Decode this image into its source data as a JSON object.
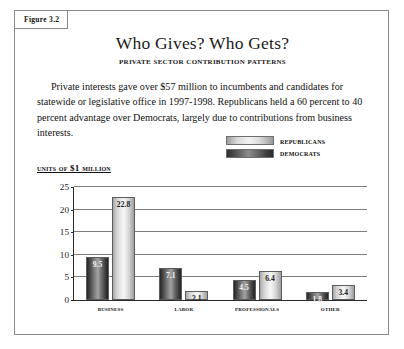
{
  "figure": {
    "tag": "Figure 3.2",
    "title": "Who Gives? Who Gets?",
    "subtitle": "Private Sector Contribution Patterns",
    "body": "Private interests gave over $57 million to incumbents and candidates for statewide or legislative office in 1997-1998. Republicans held a 60 percent to 40 percent advantage over Democrats, largely due to contributions from business interests.",
    "units_label": "Units of $1 Million",
    "border_color": "#8a8a8a"
  },
  "legend": {
    "items": [
      {
        "label": "Republicans",
        "swatch": "light-gradient-swatch",
        "color": "#f3f3f3"
      },
      {
        "label": "Democrats",
        "swatch": "dark-gradient-swatch",
        "color": "#3a3a3a"
      }
    ]
  },
  "chart_data": {
    "type": "bar",
    "title": "Who Gives? Who Gets?",
    "subtitle": "Private Sector Contribution Patterns",
    "xlabel": "",
    "ylabel": "Units of $1 Million",
    "categories": [
      "Business",
      "Labor",
      "Professionals",
      "Other"
    ],
    "series": [
      {
        "name": "Democrats",
        "values": [
          9.5,
          7.1,
          4.5,
          1.8
        ]
      },
      {
        "name": "Republicans",
        "values": [
          22.8,
          2.1,
          6.4,
          3.4
        ]
      }
    ],
    "ylim": [
      0,
      25
    ],
    "yticks": [
      0,
      5,
      10,
      15,
      20,
      25
    ],
    "grid": "horizontal",
    "legend_position": "above-right",
    "data_labels": true
  }
}
